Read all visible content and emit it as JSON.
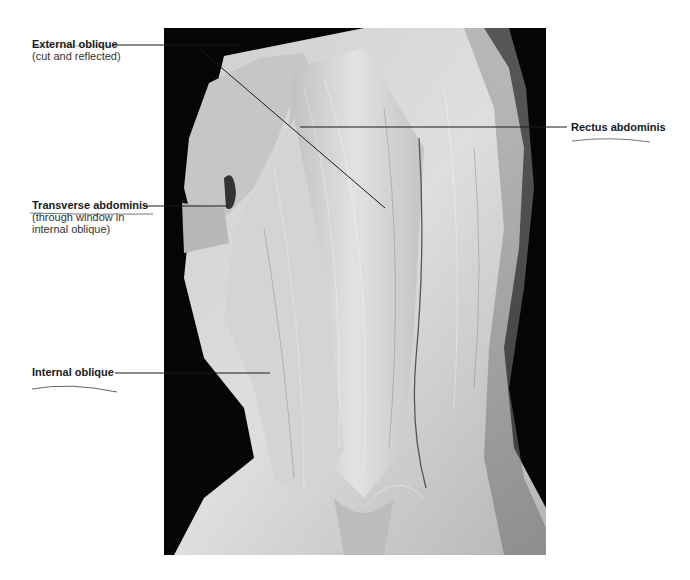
{
  "figure": {
    "colors": {
      "background": "#ffffff",
      "photo_backdrop": "#050505",
      "tissue_light": "#d8d8d8",
      "tissue_mid": "#a9a9a9",
      "leader_line": "#1a1a1a",
      "pen_mark": "#555555"
    }
  },
  "labels": [
    {
      "id": "external-oblique",
      "title": "External oblique",
      "note": "(cut and reflected)"
    },
    {
      "id": "transverse-abdominis",
      "title": "Transverse abdominis",
      "note_line1": "(through window in",
      "note_line2": "internal oblique)"
    },
    {
      "id": "internal-oblique",
      "title": "Internal oblique"
    },
    {
      "id": "rectus-abdominis",
      "title": "Rectus abdominis"
    }
  ]
}
